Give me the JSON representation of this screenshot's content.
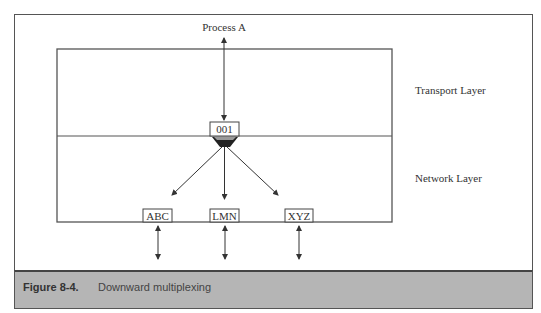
{
  "diagram": {
    "process_label": "Process A",
    "upper_layer_label": "Transport Layer",
    "lower_layer_label": "Network Layer",
    "port_label": "001",
    "network_connections": [
      {
        "label": "ABC"
      },
      {
        "label": "LMN"
      },
      {
        "label": "XYZ"
      }
    ]
  },
  "caption": {
    "number": "Figure 8-4.",
    "text": "Downward multiplexing"
  },
  "colors": {
    "line": "#444444",
    "caption_bg": "#b5b5b5",
    "funnel_dark": "#222222",
    "funnel_light": "#9a9a9a"
  }
}
